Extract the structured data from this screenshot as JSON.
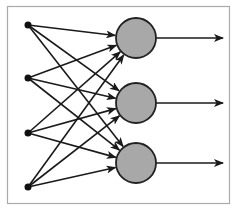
{
  "diagram": {
    "type": "neural-network-single-layer",
    "frame": {
      "x": 7,
      "y": 6,
      "width": 222,
      "height": 197,
      "stroke": "#aaaaaa",
      "fill": "#ffffff"
    },
    "colors": {
      "edge": "#1a1a1a",
      "input_node": "#111111",
      "neuron_fill": "#a8a8a8",
      "neuron_stroke": "#222222"
    },
    "inputs": [
      {
        "id": "x1",
        "x": 28,
        "y": 25,
        "r": 3.5
      },
      {
        "id": "x2",
        "x": 28,
        "y": 78,
        "r": 3.5
      },
      {
        "id": "x3",
        "x": 28,
        "y": 133,
        "r": 3.5
      },
      {
        "id": "x4",
        "x": 28,
        "y": 187,
        "r": 3.5
      }
    ],
    "neurons": [
      {
        "id": "n1",
        "x": 136,
        "y": 38,
        "r": 20
      },
      {
        "id": "n2",
        "x": 136,
        "y": 103,
        "r": 20
      },
      {
        "id": "n3",
        "x": 136,
        "y": 163,
        "r": 20
      }
    ],
    "outputs": [
      {
        "from": "n1",
        "x_end": 223
      },
      {
        "from": "n2",
        "x_end": 223
      },
      {
        "from": "n3",
        "x_end": 223
      }
    ],
    "connections": "all-to-all"
  }
}
